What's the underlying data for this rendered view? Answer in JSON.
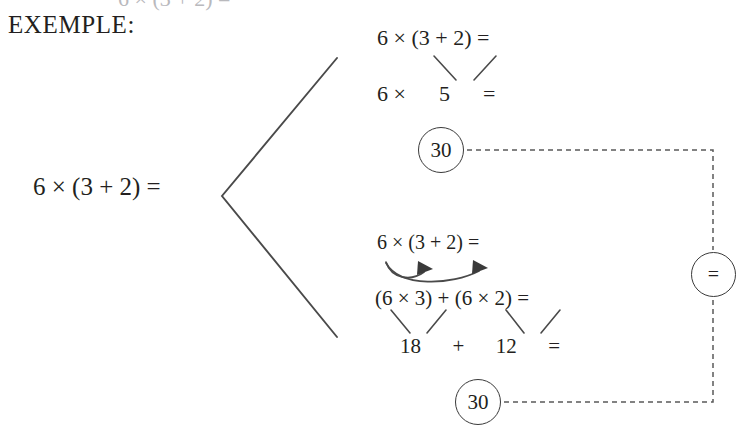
{
  "page": {
    "background_color": "#ffffff",
    "ink_color": "#231f20",
    "line_color": "#3a3a3a",
    "width": 755,
    "height": 429
  },
  "heading": {
    "label": "EXEMPLE:"
  },
  "top_cropped_fragment": {
    "text": "6 × (3 + 2) ="
  },
  "source_expression": {
    "text": "6 × (3 + 2) ="
  },
  "branch_a": {
    "name": "order-of-operations-branch",
    "step_1": "6 × (3 + 2) =",
    "step_2": "6 ×      5      =",
    "result": "30"
  },
  "branch_b": {
    "name": "distributive-property-branch",
    "step_1": "6 × (3 + 2) =",
    "step_2": "(6 × 3) + (6 × 2) =",
    "step_3": "18      +      12      =",
    "result": "30"
  },
  "equality_node": {
    "symbol": "="
  },
  "connectors": {
    "bracket": "chevron-bracket",
    "arrow_1": "distribute-arrow-to-3",
    "arrow_2": "distribute-arrow-to-2",
    "dashed_top": "dashed-link-top-result-to-equals",
    "dashed_bottom": "dashed-link-bottom-result-to-equals"
  }
}
